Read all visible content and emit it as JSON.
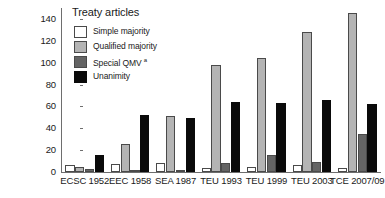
{
  "chart_data": {
    "type": "bar",
    "title": "",
    "xlabel": "",
    "ylabel": "",
    "ylim": [
      0,
      150
    ],
    "yticks": [
      0,
      20,
      40,
      60,
      80,
      100,
      120,
      140
    ],
    "grid": false,
    "legend_position": "top-left",
    "legend_title": "Treaty articles",
    "footnote_marker": "a",
    "categories": [
      "ECSC 1952",
      "EEC 1958",
      "SEA 1987",
      "TEU 1993",
      "TEU 1999",
      "TEU 2003",
      "TCE 2007/09"
    ],
    "series": [
      {
        "name": "Simple majority",
        "color": "#ffffff",
        "values": [
          6,
          7,
          8,
          4,
          5,
          6,
          4
        ]
      },
      {
        "name": "Qualified majority",
        "color": "#b4b4b4",
        "values": [
          5,
          26,
          51,
          98,
          104,
          128,
          145
        ]
      },
      {
        "name": "Special QMV",
        "color": "#646464",
        "values": [
          3,
          1,
          2,
          8,
          16,
          9,
          35
        ]
      },
      {
        "name": "Unanimity",
        "color": "#0a0a0a",
        "values": [
          16,
          52,
          49,
          64,
          63,
          66,
          62
        ]
      }
    ]
  },
  "legend": {
    "title": "Treaty articles",
    "items": [
      {
        "label": "Simple majority",
        "superscript": ""
      },
      {
        "label": "Qualified majority",
        "superscript": ""
      },
      {
        "label": "Special QMV ",
        "superscript": "a"
      },
      {
        "label": "Unanimity",
        "superscript": ""
      }
    ]
  },
  "axis": {
    "y_ticks": [
      "0",
      "20",
      "40",
      "60",
      "80",
      "100",
      "120",
      "140"
    ]
  }
}
